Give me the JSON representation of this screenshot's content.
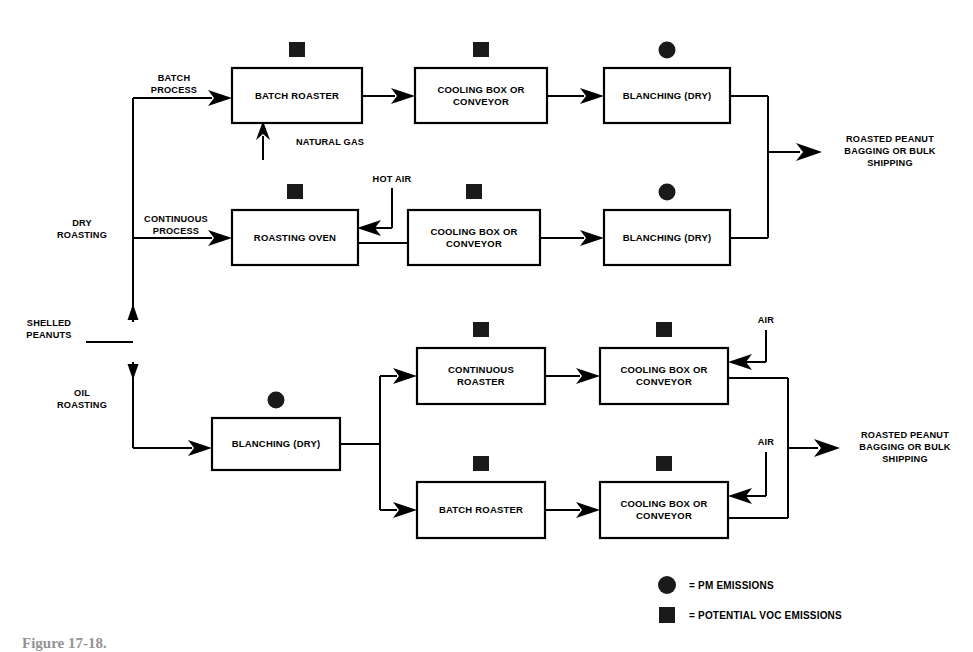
{
  "figure": {
    "caption": "Figure 17-18."
  },
  "inputs": {
    "shelled_peanuts": "SHELLED\nPEANUTS",
    "dry_roasting": "DRY\nROASTING",
    "oil_roasting": "OIL\nROASTING",
    "batch_process": "BATCH\nPROCESS",
    "continuous_process": "CONTINUOUS\nPROCESS",
    "natural_gas": "NATURAL GAS",
    "hot_air": "HOT AIR",
    "air_top": "AIR",
    "air_bottom": "AIR"
  },
  "outputs": {
    "dry_output": "ROASTED PEANUT\nBAGGING OR BULK\nSHIPPING",
    "oil_output": "ROASTED PEANUT\nBAGGING OR BULK\nSHIPPING"
  },
  "boxes": [
    {
      "id": "batch-roaster-dry",
      "label": "BATCH ROASTER",
      "x": 232,
      "y": 68,
      "w": 130,
      "h": 55,
      "marker": "square"
    },
    {
      "id": "cooling-box-dry-1",
      "label": "COOLING BOX OR\nCONVEYOR",
      "x": 415,
      "y": 68,
      "w": 132,
      "h": 55,
      "marker": "square"
    },
    {
      "id": "blanching-dry-1",
      "label": "BLANCHING (DRY)",
      "x": 604,
      "y": 68,
      "w": 126,
      "h": 55,
      "marker": "circle"
    },
    {
      "id": "roasting-oven",
      "label": "ROASTING OVEN",
      "x": 232,
      "y": 210,
      "w": 126,
      "h": 55,
      "marker": "square"
    },
    {
      "id": "cooling-box-dry-2",
      "label": "COOLING BOX OR\nCONVEYOR",
      "x": 408,
      "y": 210,
      "w": 132,
      "h": 55,
      "marker": "square"
    },
    {
      "id": "blanching-dry-2",
      "label": "BLANCHING (DRY)",
      "x": 604,
      "y": 210,
      "w": 126,
      "h": 55,
      "marker": "circle"
    },
    {
      "id": "blanching-oil",
      "label": "BLANCHING (DRY)",
      "x": 212,
      "y": 418,
      "w": 128,
      "h": 52,
      "marker": "circle"
    },
    {
      "id": "continuous-roaster",
      "label": "CONTINUOUS\nROASTER",
      "x": 417,
      "y": 348,
      "w": 128,
      "h": 56,
      "marker": "square"
    },
    {
      "id": "cooling-box-oil-1",
      "label": "COOLING BOX OR\nCONVEYOR",
      "x": 600,
      "y": 348,
      "w": 128,
      "h": 56,
      "marker": "square"
    },
    {
      "id": "batch-roaster-oil",
      "label": "BATCH ROASTER",
      "x": 417,
      "y": 482,
      "w": 128,
      "h": 56,
      "marker": "square"
    },
    {
      "id": "cooling-box-oil-2",
      "label": "COOLING BOX OR\nCONVEYOR",
      "x": 600,
      "y": 482,
      "w": 128,
      "h": 56,
      "marker": "square"
    }
  ],
  "legend": {
    "items": [
      {
        "shape": "circle",
        "text": "= PM EMISSIONS"
      },
      {
        "shape": "square",
        "text": "= POTENTIAL VOC EMISSIONS"
      }
    ]
  },
  "colors": {
    "line": "#000000",
    "box_fill": "#ffffff",
    "marker": "#1a1a1a",
    "background": "#ffffff"
  }
}
